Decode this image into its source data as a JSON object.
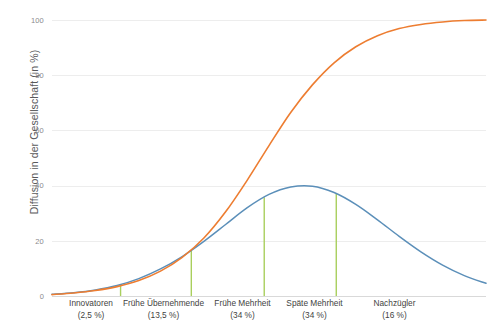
{
  "chart_data": {
    "type": "line",
    "title": "",
    "xlabel": "",
    "ylabel": "Diffusion in der Gesellschaft (in %)",
    "ylim": [
      0,
      100
    ],
    "yticks": [
      0,
      20,
      40,
      60,
      80,
      100
    ],
    "ytick_labels": [
      "0",
      "20",
      "40",
      "60",
      "80",
      "100"
    ],
    "grid": true,
    "legend": "none",
    "categories": [
      "Innovatoren",
      "Frühe Übernehmende",
      "Frühe Mehrheit",
      "Späte Mehrheit",
      "Nachzügler"
    ],
    "category_shares": [
      "(2,5 %)",
      "(13,5 %)",
      "(34 %)",
      "(34 %)",
      "(16 %)"
    ],
    "category_share_values": [
      2.5,
      13.5,
      34,
      34,
      16
    ],
    "series": [
      {
        "name": "Adoptergruppen (Normalverteilung)",
        "type": "line",
        "color": "#5b8fb9",
        "x": [
          0,
          5,
          10,
          15,
          20,
          25,
          30,
          35,
          40,
          45,
          50,
          55,
          60,
          65,
          70,
          75,
          80,
          85,
          90,
          95,
          100
        ],
        "values": [
          0.6,
          1.2,
          2.2,
          3.8,
          6.3,
          9.8,
          14.3,
          19.8,
          25.9,
          32.0,
          36.8,
          39.5,
          39.8,
          37.5,
          33.2,
          27.6,
          21.6,
          16.0,
          11.2,
          7.4,
          4.6
        ]
      },
      {
        "name": "Kumulierte Diffusion (S-Kurve)",
        "type": "line",
        "color": "#ed7d31",
        "x": [
          0,
          5,
          10,
          15,
          20,
          25,
          30,
          35,
          40,
          45,
          50,
          55,
          60,
          65,
          70,
          75,
          80,
          85,
          90,
          95,
          100
        ],
        "values": [
          0.5,
          1.1,
          2.0,
          3.4,
          5.6,
          9.0,
          14.0,
          21.0,
          30.5,
          42.0,
          54.5,
          66.5,
          76.5,
          84.5,
          90.3,
          94.3,
          96.9,
          98.4,
          99.3,
          99.8,
          100.0
        ]
      }
    ],
    "separators": {
      "name": "Kategorie-Trennlinien",
      "color": "#a9cf5d",
      "x_positions": [
        15.8,
        32.1,
        48.9,
        65.5
      ]
    }
  }
}
